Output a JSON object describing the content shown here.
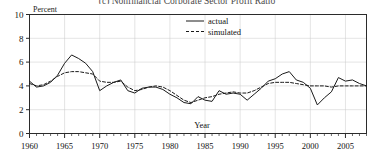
{
  "figure": {
    "title": "(c) Nonfinancial Corporate Sector Profit Ratio",
    "title_visible_fragment": "(c) Nonfinancial Corporate Sector Profit Ratio"
  },
  "chart_data": {
    "type": "line",
    "title": "(c) Nonfinancial Corporate Sector Profit Ratio",
    "xlabel": "Year",
    "ylabel": "Percent",
    "xlim": [
      1960,
      2008
    ],
    "ylim": [
      0,
      10
    ],
    "ytick_labels": [
      "0",
      "2",
      "4",
      "6",
      "8",
      "10"
    ],
    "yticks": [
      0,
      2,
      4,
      6,
      8,
      10
    ],
    "xtick_labels": [
      "1960",
      "1965",
      "1970",
      "1975",
      "1980",
      "1985",
      "1990",
      "1995",
      "2000",
      "2005"
    ],
    "xticks": [
      1960,
      1965,
      1970,
      1975,
      1980,
      1985,
      1990,
      1995,
      2000,
      2005
    ],
    "minor_xtick_interval": 1,
    "grid": "major-y-and-x-light",
    "legend_position": "top-center",
    "x": [
      1960,
      1961,
      1962,
      1963,
      1964,
      1965,
      1966,
      1967,
      1968,
      1969,
      1970,
      1971,
      1972,
      1973,
      1974,
      1975,
      1976,
      1977,
      1978,
      1979,
      1980,
      1981,
      1982,
      1983,
      1984,
      1985,
      1986,
      1987,
      1988,
      1989,
      1990,
      1991,
      1992,
      1993,
      1994,
      1995,
      1996,
      1997,
      1998,
      1999,
      2000,
      2001,
      2002,
      2003,
      2004,
      2005,
      2006,
      2007,
      2008
    ],
    "series": [
      {
        "name": "actual",
        "style": "solid",
        "color": "#1a1a1a",
        "values": [
          4.4,
          3.9,
          4.0,
          4.3,
          4.9,
          5.9,
          6.6,
          6.3,
          5.9,
          5.2,
          3.6,
          4.0,
          4.3,
          4.5,
          3.6,
          3.4,
          3.8,
          3.9,
          3.9,
          3.7,
          3.3,
          3.0,
          2.6,
          2.5,
          3.1,
          2.8,
          2.7,
          3.6,
          3.3,
          3.4,
          3.3,
          2.8,
          3.3,
          3.8,
          4.4,
          4.6,
          5.0,
          5.2,
          4.5,
          4.3,
          3.8,
          2.4,
          3.0,
          3.5,
          4.7,
          4.4,
          4.5,
          4.2,
          4.0
        ]
      },
      {
        "name": "simulated",
        "style": "dashed",
        "color": "#1a1a1a",
        "values": [
          4.2,
          4.0,
          4.1,
          4.4,
          4.8,
          5.1,
          5.2,
          5.2,
          5.1,
          5.0,
          4.4,
          4.3,
          4.3,
          4.4,
          3.9,
          3.6,
          3.7,
          3.9,
          4.0,
          3.9,
          3.6,
          3.2,
          2.8,
          2.6,
          2.8,
          3.0,
          3.1,
          3.3,
          3.4,
          3.5,
          3.4,
          3.4,
          3.6,
          3.9,
          4.2,
          4.3,
          4.3,
          4.3,
          4.2,
          4.1,
          4.0,
          4.0,
          4.0,
          3.9,
          4.0,
          4.0,
          4.0,
          4.0,
          4.0
        ]
      }
    ],
    "legend": [
      {
        "label": "actual",
        "style": "solid"
      },
      {
        "label": "simulated",
        "style": "dashed"
      }
    ]
  }
}
